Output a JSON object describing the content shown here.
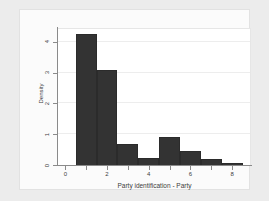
{
  "chart_data": {
    "type": "bar",
    "title": "",
    "xlabel": "Party identification - Party",
    "ylabel": "Density",
    "xlim": [
      -0.35,
      8.9
    ],
    "ylim": [
      0,
      4.45
    ],
    "grid": true,
    "legend": null,
    "bar_width": 1,
    "bin_starts": [
      0.5,
      1.5,
      2.5,
      3.5,
      4.5,
      5.5,
      6.5,
      7.5
    ],
    "bin_ends": [
      1.5,
      2.5,
      3.5,
      4.5,
      5.5,
      6.5,
      7.5,
      8.5
    ],
    "categories": [
      "0.5-1.5",
      "1.5-2.5",
      "2.5-3.5",
      "3.5-4.5",
      "4.5-5.5",
      "5.5-6.5",
      "6.5-7.5",
      "7.5-8.5"
    ],
    "values": [
      4.25,
      3.1,
      0.67,
      0.22,
      0.9,
      0.47,
      0.19,
      0.05
    ],
    "xticks": [
      0,
      1,
      2,
      3,
      4,
      5,
      6,
      7,
      8
    ],
    "xtick_labels": [
      "0",
      "",
      "2",
      "",
      "4",
      "",
      "6",
      "",
      "8"
    ],
    "yticks": [
      0,
      1,
      2,
      3,
      4
    ],
    "ytick_labels": [
      "0",
      "1",
      "2",
      "3",
      "4"
    ],
    "bar_color": "#333333",
    "plot_background": "#ffffff",
    "figure_background": "#ececec",
    "gridline_color": "#ededed",
    "axis_color": "#8a8a8a"
  }
}
